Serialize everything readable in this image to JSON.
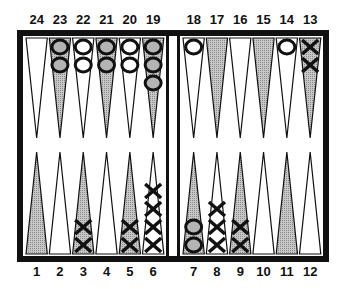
{
  "board": {
    "frame_color": "#111111",
    "shade_color": "#b4b4b4",
    "light_color": "#ffffff",
    "top_labels": [
      "24",
      "23",
      "22",
      "21",
      "20",
      "19",
      "18",
      "17",
      "16",
      "15",
      "14",
      "13"
    ],
    "bottom_labels": [
      "1",
      "2",
      "3",
      "4",
      "5",
      "6",
      "7",
      "8",
      "9",
      "10",
      "11",
      "12"
    ],
    "shaded_points": [
      1,
      3,
      5,
      7,
      9,
      11,
      13,
      15,
      17,
      19,
      21,
      23
    ],
    "checkers": [
      {
        "point": 23,
        "type": "O",
        "count": 2
      },
      {
        "point": 22,
        "type": "O",
        "count": 2
      },
      {
        "point": 21,
        "type": "O",
        "count": 2
      },
      {
        "point": 20,
        "type": "O",
        "count": 2
      },
      {
        "point": 19,
        "type": "O",
        "count": 3
      },
      {
        "point": 18,
        "type": "O",
        "count": 1
      },
      {
        "point": 14,
        "type": "O",
        "count": 1
      },
      {
        "point": 13,
        "type": "X",
        "count": 2
      },
      {
        "point": 3,
        "type": "X",
        "count": 2
      },
      {
        "point": 5,
        "type": "X",
        "count": 2
      },
      {
        "point": 6,
        "type": "X",
        "count": 4
      },
      {
        "point": 7,
        "type": "O",
        "count": 2
      },
      {
        "point": 8,
        "type": "X",
        "count": 3
      },
      {
        "point": 9,
        "type": "X",
        "count": 2
      }
    ]
  }
}
